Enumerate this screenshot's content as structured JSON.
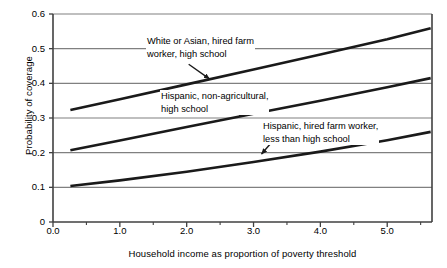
{
  "chart_data": {
    "type": "line",
    "title": "",
    "subtitle": "",
    "xlabel": "Household income as proportion of poverty threshold",
    "ylabel": "Probability of coverage",
    "xlim": [
      0.0,
      5.67
    ],
    "ylim": [
      0.0,
      0.6
    ],
    "xticks": [
      "0.0",
      "1.0",
      "2.0",
      "3.0",
      "4.0",
      "5.0"
    ],
    "xtick_values": [
      0.0,
      1.0,
      2.0,
      3.0,
      4.0,
      5.0
    ],
    "xminor_tick_values": [
      0.5,
      1.5,
      2.5,
      3.5,
      4.5,
      5.5
    ],
    "yticks": [
      "0",
      "0.1",
      "0.2",
      "0.3",
      "0.4",
      "0.5",
      "0.6"
    ],
    "ytick_values": [
      0.0,
      0.1,
      0.2,
      0.3,
      0.4,
      0.5,
      0.6
    ],
    "grid": "horizontal",
    "legend_position": "none",
    "line_color": "#1a1a1a",
    "grid_color": "#808080",
    "axis_color": "#404040",
    "background": "#ffffff",
    "series": [
      {
        "name": "White or Asian, hired farm worker, high school",
        "x": [
          0.26,
          1.0,
          2.0,
          3.0,
          4.0,
          5.0,
          5.65
        ],
        "values": [
          0.323,
          0.354,
          0.397,
          0.44,
          0.483,
          0.527,
          0.559
        ]
      },
      {
        "name": "Hispanic, non-agricultural, high school",
        "x": [
          0.26,
          1.0,
          2.0,
          3.0,
          4.0,
          5.0,
          5.65
        ],
        "values": [
          0.207,
          0.235,
          0.274,
          0.312,
          0.35,
          0.389,
          0.415
        ]
      },
      {
        "name": "Hispanic, hired farm worker, less than high school",
        "x": [
          0.26,
          1.0,
          2.0,
          3.0,
          4.0,
          5.0,
          5.65
        ],
        "values": [
          0.104,
          0.12,
          0.145,
          0.173,
          0.203,
          0.236,
          0.26
        ]
      }
    ],
    "annotations": [
      {
        "id": "white-asian",
        "line1": "White or Asian, hired farm",
        "line2": "worker, high school",
        "arrow_from": [
          2.03,
          0.455
        ],
        "arrow_to": [
          2.34,
          0.413
        ]
      },
      {
        "id": "hispanic-nonag",
        "line1": "Hispanic, non-agricultural,",
        "line2": "high school",
        "arrow_from": [
          2.62,
          0.323
        ],
        "arrow_to": [
          2.87,
          0.307
        ]
      },
      {
        "id": "hispanic-farm",
        "line1": "Hispanic, hired farm worker,",
        "line2": "less than high school",
        "arrow_from": [
          3.33,
          0.243
        ],
        "arrow_to": [
          3.12,
          0.196
        ]
      }
    ]
  }
}
